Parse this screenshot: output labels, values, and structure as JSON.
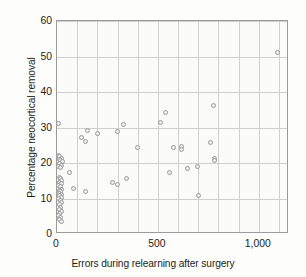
{
  "chart_data": {
    "type": "scatter",
    "title": "",
    "xlabel": "Errors during relearning after surgery",
    "ylabel": "Percentage neocortical removal",
    "xlim": [
      0,
      1150
    ],
    "ylim": [
      0,
      60
    ],
    "xticks": [
      0,
      500,
      1000
    ],
    "xticklabels": [
      "0",
      "500",
      "1,000"
    ],
    "yticks": [
      0,
      10,
      20,
      30,
      40,
      50,
      60
    ],
    "yticklabels": [
      "0",
      "10",
      "20",
      "30",
      "40",
      "50",
      "60"
    ],
    "grid": true,
    "legend": null,
    "marker_color": "#9a9a9a",
    "marker_fill": "#efefef",
    "points": [
      [
        5,
        31.0
      ],
      [
        8,
        22.2
      ],
      [
        14,
        21.8
      ],
      [
        20,
        21.3
      ],
      [
        10,
        20.9
      ],
      [
        18,
        20.6
      ],
      [
        25,
        20.3
      ],
      [
        12,
        19.9
      ],
      [
        22,
        19.4
      ],
      [
        8,
        19.0
      ],
      [
        16,
        18.6
      ],
      [
        60,
        17.2
      ],
      [
        10,
        16.0
      ],
      [
        18,
        15.6
      ],
      [
        24,
        15.2
      ],
      [
        12,
        14.6
      ],
      [
        20,
        14.2
      ],
      [
        8,
        13.7
      ],
      [
        16,
        13.3
      ],
      [
        80,
        12.8
      ],
      [
        22,
        12.6
      ],
      [
        10,
        12.2
      ],
      [
        18,
        11.9
      ],
      [
        14,
        11.5
      ],
      [
        24,
        11.2
      ],
      [
        140,
        11.9
      ],
      [
        12,
        10.8
      ],
      [
        20,
        10.4
      ],
      [
        8,
        9.9
      ],
      [
        16,
        9.4
      ],
      [
        22,
        8.8
      ],
      [
        12,
        8.2
      ],
      [
        18,
        7.6
      ],
      [
        10,
        7.0
      ],
      [
        20,
        6.4
      ],
      [
        14,
        5.8
      ],
      [
        8,
        5.2
      ],
      [
        16,
        4.6
      ],
      [
        12,
        4.0
      ],
      [
        20,
        3.5
      ],
      [
        120,
        27.3
      ],
      [
        150,
        29.1
      ],
      [
        140,
        26.1
      ],
      [
        200,
        28.3
      ],
      [
        275,
        14.6
      ],
      [
        300,
        13.9
      ],
      [
        300,
        28.9
      ],
      [
        330,
        30.8
      ],
      [
        345,
        15.7
      ],
      [
        400,
        24.4
      ],
      [
        540,
        34.1
      ],
      [
        515,
        31.5
      ],
      [
        575,
        24.3
      ],
      [
        560,
        17.3
      ],
      [
        615,
        24.6
      ],
      [
        618,
        23.9
      ],
      [
        645,
        18.5
      ],
      [
        695,
        18.9
      ],
      [
        700,
        10.9
      ],
      [
        760,
        25.9
      ],
      [
        775,
        36.3
      ],
      [
        780,
        21.3
      ],
      [
        782,
        20.6
      ],
      [
        1095,
        51.1
      ]
    ]
  }
}
